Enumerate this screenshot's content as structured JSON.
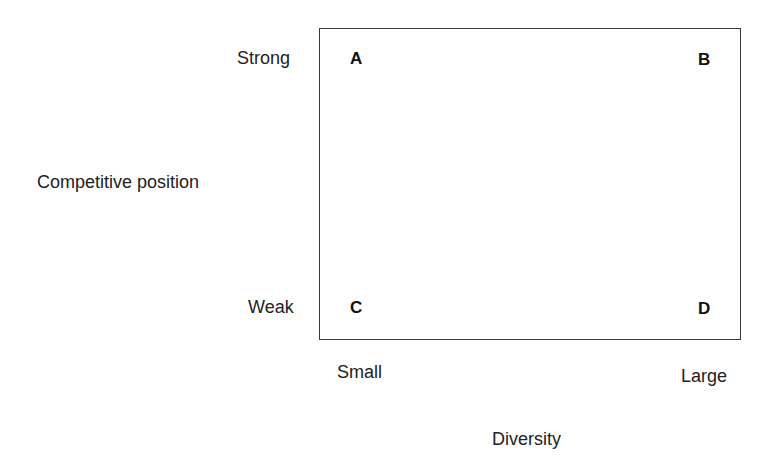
{
  "diagram": {
    "type": "2x2 matrix",
    "y_axis": {
      "title": "Competitive position",
      "top_label": "Strong",
      "bottom_label": "Weak"
    },
    "x_axis": {
      "title": "Diversity",
      "left_label": "Small",
      "right_label": "Large"
    },
    "quadrants": {
      "top_left": "A",
      "top_right": "B",
      "bottom_left": "C",
      "bottom_right": "D"
    },
    "colors": {
      "border": "#3a3a3a",
      "text": "#1e1e1e",
      "background": "#ffffff"
    }
  }
}
